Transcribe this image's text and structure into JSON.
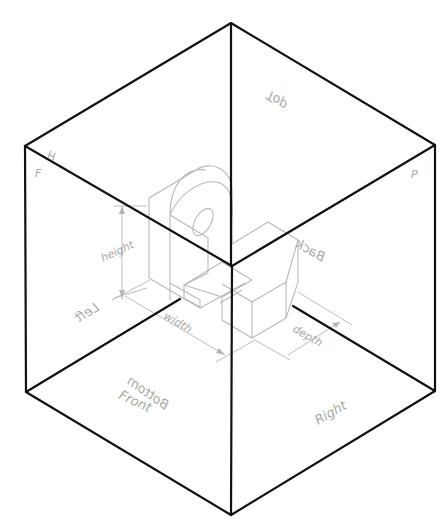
{
  "diagram": {
    "colors": {
      "box_edge": "#111111",
      "object_line": "#b8b8b8",
      "label": "#a8a8a8",
      "background": "#ffffff"
    },
    "plane_labels": {
      "top": "Top",
      "front": "Front",
      "right": "Right",
      "left": "Left",
      "back": "Back",
      "bottom": "Bottom"
    },
    "fold_labels": {
      "h": "H",
      "f": "F",
      "p": "P"
    },
    "dimension_labels": {
      "height": "height",
      "width": "width",
      "depth": "depth"
    }
  }
}
